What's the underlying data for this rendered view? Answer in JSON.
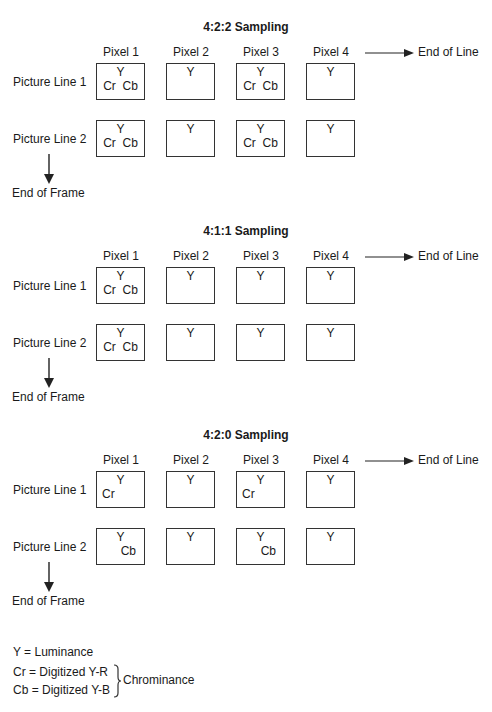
{
  "sections": [
    {
      "title": "4:2:2 Sampling",
      "columns": [
        "Pixel 1",
        "Pixel 2",
        "Pixel 3",
        "Pixel 4"
      ],
      "rows": [
        {
          "label": "Picture Line 1",
          "cells": [
            {
              "y": "Y",
              "c": "Cr  Cb",
              "align": "center"
            },
            {
              "y": "Y",
              "c": "",
              "align": "center"
            },
            {
              "y": "Y",
              "c": "Cr  Cb",
              "align": "center"
            },
            {
              "y": "Y",
              "c": "",
              "align": "center"
            }
          ]
        },
        {
          "label": "Picture Line 2",
          "cells": [
            {
              "y": "Y",
              "c": "Cr  Cb",
              "align": "center"
            },
            {
              "y": "Y",
              "c": "",
              "align": "center"
            },
            {
              "y": "Y",
              "c": "Cr  Cb",
              "align": "center"
            },
            {
              "y": "Y",
              "c": "",
              "align": "center"
            }
          ]
        }
      ],
      "end_of_line": "End of Line",
      "end_of_frame": "End of Frame"
    },
    {
      "title": "4:1:1 Sampling",
      "columns": [
        "Pixel 1",
        "Pixel 2",
        "Pixel 3",
        "Pixel 4"
      ],
      "rows": [
        {
          "label": "Picture Line 1",
          "cells": [
            {
              "y": "Y",
              "c": "Cr  Cb",
              "align": "center"
            },
            {
              "y": "Y",
              "c": "",
              "align": "center"
            },
            {
              "y": "Y",
              "c": "",
              "align": "center"
            },
            {
              "y": "Y",
              "c": "",
              "align": "center"
            }
          ]
        },
        {
          "label": "Picture Line 2",
          "cells": [
            {
              "y": "Y",
              "c": "Cr  Cb",
              "align": "center"
            },
            {
              "y": "Y",
              "c": "",
              "align": "center"
            },
            {
              "y": "Y",
              "c": "",
              "align": "center"
            },
            {
              "y": "Y",
              "c": "",
              "align": "center"
            }
          ]
        }
      ],
      "end_of_line": "End of Line",
      "end_of_frame": "End of Frame"
    },
    {
      "title": "4:2:0 Sampling",
      "columns": [
        "Pixel 1",
        "Pixel 2",
        "Pixel 3",
        "Pixel 4"
      ],
      "rows": [
        {
          "label": "Picture Line 1",
          "cells": [
            {
              "y": "Y",
              "c": "Cr",
              "align": "left"
            },
            {
              "y": "Y",
              "c": "",
              "align": "center"
            },
            {
              "y": "Y",
              "c": "Cr",
              "align": "left"
            },
            {
              "y": "Y",
              "c": "",
              "align": "center"
            }
          ]
        },
        {
          "label": "Picture Line 2",
          "cells": [
            {
              "y": "Y",
              "c": "Cb",
              "align": "right"
            },
            {
              "y": "Y",
              "c": "",
              "align": "center"
            },
            {
              "y": "Y",
              "c": "Cb",
              "align": "right"
            },
            {
              "y": "Y",
              "c": "",
              "align": "center"
            }
          ]
        }
      ],
      "end_of_line": "End of Line",
      "end_of_frame": "End of Frame"
    }
  ],
  "legend": {
    "y": "Y = Luminance",
    "cr": "Cr = Digitized Y-R",
    "cb": "Cb = Digitized Y-B",
    "brace_label": "Chrominance"
  }
}
